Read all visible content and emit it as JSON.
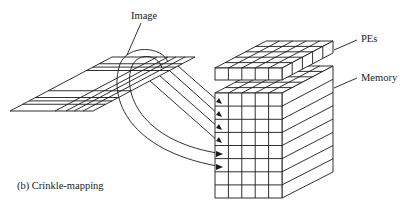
{
  "figure": {
    "caption": "(b) Crinkle-mapping",
    "labels": {
      "image": "Image",
      "pes": "PEs",
      "memory": "Memory"
    },
    "image_plane": {
      "rows": 8,
      "cols": 5
    },
    "pe_array": {
      "rows": 5,
      "cols": 5
    },
    "memory_block": {
      "front_cols": 5,
      "front_rows": 8,
      "mapped_arrows": 6
    },
    "colors": {
      "ink": "#1a1a1a",
      "background": "#ffffff"
    }
  }
}
